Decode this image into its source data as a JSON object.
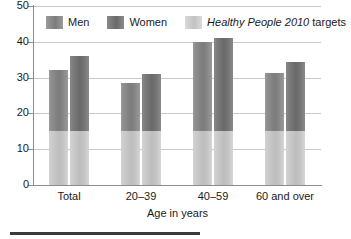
{
  "chart_data": {
    "type": "bar",
    "title": "",
    "xlabel": "Age in years",
    "ylabel": "",
    "ylim": [
      0,
      50
    ],
    "yticks": [
      0,
      10,
      20,
      30,
      40,
      50
    ],
    "ytick_labels": [
      "0",
      "10",
      "20",
      "30",
      "40",
      "50"
    ],
    "grid": true,
    "legend_position": "top-inside",
    "categories": [
      "Total",
      "20–39",
      "40–59",
      "60 and over"
    ],
    "series": [
      {
        "name": "Men",
        "color": "#7c7c7c",
        "values": [
          32,
          28.5,
          40,
          31.3
        ]
      },
      {
        "name": "Women",
        "color": "#6a6a6a",
        "values": [
          36,
          31,
          41,
          34.5
        ]
      },
      {
        "name": "Healthy People 2010 targets",
        "color": "#c2c2c2",
        "value": 15,
        "note": "target level shown as light shaded portion at the base of every bar"
      }
    ],
    "legend": [
      {
        "key": "men",
        "label": "Men",
        "label_italic": ""
      },
      {
        "key": "women",
        "label": "Women",
        "label_italic": ""
      },
      {
        "key": "target",
        "label": " targets",
        "label_italic": "Healthy People 2010"
      }
    ]
  }
}
